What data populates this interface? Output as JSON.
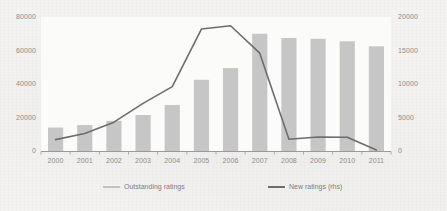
{
  "chart_data": {
    "type": "bar",
    "title": "",
    "subtitle": "",
    "xlabel": "",
    "ylabel": "",
    "grid": false,
    "legend_position": "bottom",
    "categories": [
      "2000",
      "2001",
      "2002",
      "2003",
      "2004",
      "2005",
      "2006",
      "2007",
      "2008",
      "2009",
      "2010",
      "2011"
    ],
    "axes": {
      "left": {
        "ylim": [
          0,
          80000
        ],
        "ticks": [
          0,
          20000,
          40000,
          60000,
          80000
        ],
        "tick_labels": [
          "0",
          "20000",
          "40000",
          "60000",
          "80000"
        ]
      },
      "right": {
        "ylim": [
          0,
          20000
        ],
        "ticks": [
          0,
          5000,
          10000,
          15000,
          20000
        ],
        "tick_labels": [
          "0",
          "5000",
          "10000",
          "15000",
          "20000"
        ]
      }
    },
    "series": [
      {
        "name": "Outstanding ratings",
        "type": "bar",
        "axis": "left",
        "color": "#c6c6c6",
        "values": [
          14000,
          15500,
          18000,
          21500,
          27500,
          42500,
          49500,
          70000,
          67500,
          67000,
          65500,
          62500
        ]
      },
      {
        "name": "New ratings (rhs)",
        "type": "line",
        "axis": "right",
        "color": "#6d6d6d",
        "values": [
          1700,
          2600,
          4300,
          7100,
          9600,
          18200,
          18700,
          14600,
          1750,
          2100,
          2050,
          150
        ]
      }
    ]
  },
  "legend": {
    "entries": [
      {
        "label": "Outstanding ratings"
      },
      {
        "label": "New ratings (rhs)"
      }
    ]
  },
  "colors": {
    "background": "#f4f3f1",
    "plot_background": "#fbfbfa",
    "bar": "#c6c6c6",
    "line": "#6d6d6d",
    "axis": "#9a9a9a",
    "tick_text": "#8b8b8b"
  }
}
